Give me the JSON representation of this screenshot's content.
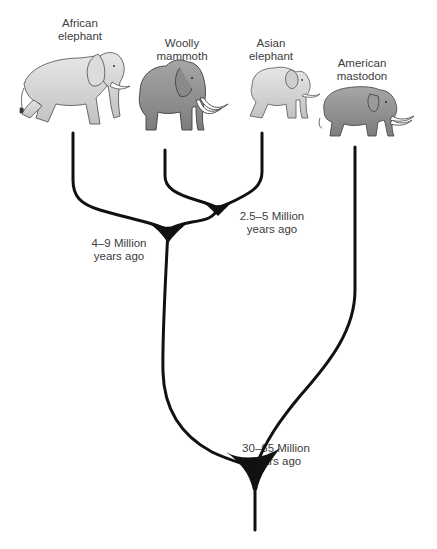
{
  "diagram": {
    "type": "phylogenetic-tree",
    "species": [
      {
        "id": "african-elephant",
        "name": "African\nelephant"
      },
      {
        "id": "woolly-mammoth",
        "name": "Woolly\nmammoth"
      },
      {
        "id": "asian-elephant",
        "name": "Asian\nelephant"
      },
      {
        "id": "american-mastodon",
        "name": "American\nmastodon"
      }
    ],
    "nodes": [
      {
        "id": "mammoth-asian-split",
        "label": "2.5–5 Million\nyears ago",
        "children": [
          "woolly-mammoth",
          "asian-elephant"
        ]
      },
      {
        "id": "african-split",
        "label": "4–9 Million\nyears ago",
        "children": [
          "african-elephant",
          "mammoth-asian-split"
        ]
      },
      {
        "id": "mastodon-split",
        "label": "30–65 Million\nyears ago",
        "children": [
          "african-split",
          "american-mastodon"
        ]
      }
    ],
    "colors": {
      "branch": "#111111",
      "label_text": "#3c3c3c",
      "elephant_light": "#d4d4d4",
      "elephant_dark": "#8f8f8f",
      "outline": "#444444",
      "tusk": "#ffffff"
    }
  }
}
